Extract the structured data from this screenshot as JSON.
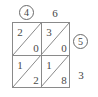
{
  "puzzle": {
    "type": "kakuro-style-triangular-grid",
    "grid": {
      "rows": 2,
      "cols": 2,
      "line_color": "#8a8a8a",
      "background": "#ffffff",
      "cells": [
        {
          "row": 0,
          "col": 0,
          "upper_left": "2",
          "lower_right": "0"
        },
        {
          "row": 0,
          "col": 1,
          "upper_left": "3",
          "lower_right": "0"
        },
        {
          "row": 1,
          "col": 0,
          "upper_left": "1",
          "lower_right": "2"
        },
        {
          "row": 1,
          "col": 1,
          "upper_left": "1",
          "lower_right": "8"
        }
      ]
    },
    "top_labels": [
      {
        "col": 0,
        "value": "4",
        "circled": true
      },
      {
        "col": 1,
        "value": "6",
        "circled": false
      }
    ],
    "right_labels": [
      {
        "row": 0,
        "value": "5",
        "circled": true
      },
      {
        "row": 1,
        "value": "3",
        "circled": false
      }
    ]
  }
}
